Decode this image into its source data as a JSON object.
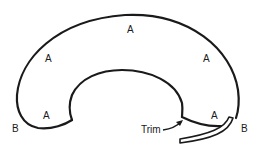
{
  "diagram": {
    "labels": {
      "a_top": "A",
      "a_upper_left": "A",
      "a_upper_right": "A",
      "a_lower_left": "A",
      "a_lower_right": "A",
      "b_left": "B",
      "b_right": "B",
      "trim": "Trim"
    },
    "colors": {
      "stroke": "#1a1a1a",
      "background": "#ffffff"
    }
  }
}
